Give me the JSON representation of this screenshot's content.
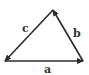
{
  "diagram": {
    "type": "vector-triangle",
    "colors": {
      "stroke": "#2b2b2b",
      "background": "#ffffff",
      "label": "#333333"
    },
    "vectors": [
      {
        "name": "a",
        "label": "a",
        "from": "bottom-left",
        "to": "bottom-right"
      },
      {
        "name": "b",
        "label": "b",
        "from": "bottom-right",
        "to": "apex"
      },
      {
        "name": "c",
        "label": "c",
        "from": "apex",
        "to": "bottom-left"
      }
    ]
  }
}
